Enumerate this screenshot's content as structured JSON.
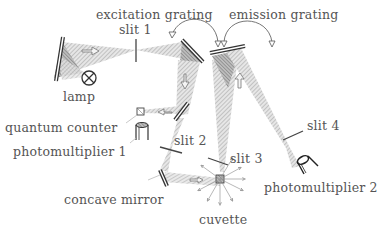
{
  "labels": {
    "excitation_grating": "excitation grating",
    "emission_grating": "emission grating",
    "slit1": "slit 1",
    "slit2": "slit 2",
    "slit3": "slit 3",
    "slit4": "slit 4",
    "lamp": "lamp",
    "quantum_counter": "quantum counter",
    "photomultiplier1": "photomultiplier 1",
    "photomultiplier2": "photomultiplier 2",
    "concave_mirror": "concave mirror",
    "cuvette": "cuvette"
  },
  "colors": {
    "line": "#333333",
    "beam": "#cfcfcf",
    "beam_dark": "#9a9a9a",
    "text": "#555555"
  }
}
